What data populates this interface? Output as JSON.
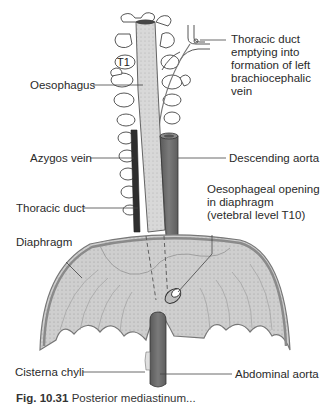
{
  "figure": {
    "vertebra_label": "T1",
    "labels": {
      "thoracic_duct_emptying": [
        "Thoracic duct",
        "emptying into",
        "formation of left",
        "brachiocephalic",
        "vein"
      ],
      "oesophagus": "Oesophagus",
      "azygos_vein": "Azygos vein",
      "descending_aorta": "Descending aorta",
      "oesophageal_opening": [
        "Oesophageal opening",
        "in diaphragm",
        "(vetebral level T10)"
      ],
      "thoracic_duct": "Thoracic duct",
      "diaphragm": "Diaphragm",
      "cisterna_chyli": "Cisterna chyli",
      "abdominal_aorta": "Abdominal aorta"
    },
    "caption": {
      "number": "Fig. 10.31",
      "text": "Posterior mediastinum..."
    },
    "colors": {
      "aorta": "#6e6e6e",
      "azygos": "#2e2e2e",
      "oesophagus": "#c4c4c4",
      "diaphragm": "#d6d6d6",
      "diaphragm_edge": "#8a8a8a",
      "outline": "#555555"
    }
  }
}
